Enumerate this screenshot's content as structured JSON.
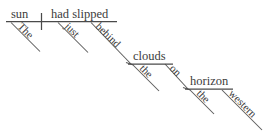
{
  "diagram": {
    "type": "reed-kellogg-sentence-diagram",
    "sentence": "The sun had slipped just behind the clouds on the western horizon.",
    "stroke_color": "#4a4a4a",
    "text_color": "#3c3c3c",
    "background_color": "#ffffff",
    "nodes": {
      "subject": "sun",
      "subject_article": "The",
      "predicate": "had slipped",
      "adverb": "just",
      "preposition_1": "behind",
      "object_1": "clouds",
      "object_1_article": "the",
      "preposition_2": "on",
      "object_2": "horizon",
      "object_2_article": "the",
      "object_2_adjective": "western"
    }
  }
}
